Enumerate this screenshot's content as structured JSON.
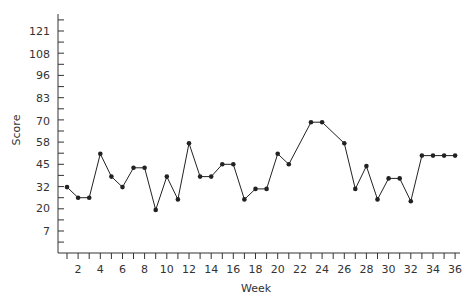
{
  "chart_data": {
    "type": "line",
    "title": "",
    "xlabel": "Week",
    "ylabel": "Score",
    "x_tick_labels": [
      2,
      4,
      6,
      8,
      10,
      12,
      14,
      16,
      18,
      20,
      22,
      24,
      26,
      28,
      30,
      32,
      34,
      36
    ],
    "y_tick_labels": [
      7,
      20,
      32,
      45,
      58,
      70,
      83,
      96,
      108,
      121
    ],
    "xlim": [
      0,
      36
    ],
    "ylim": [
      0,
      133
    ],
    "grid": false,
    "legend": null,
    "series": [
      {
        "name": "Score",
        "color": "#222222",
        "marker": "circle",
        "points": [
          {
            "x": 1,
            "y": 32
          },
          {
            "x": 2,
            "y": 26
          },
          {
            "x": 3,
            "y": 26
          },
          {
            "x": 4,
            "y": 51
          },
          {
            "x": 5,
            "y": 38
          },
          {
            "x": 6,
            "y": 32
          },
          {
            "x": 7,
            "y": 43
          },
          {
            "x": 8,
            "y": 43
          },
          {
            "x": 9,
            "y": 19
          },
          {
            "x": 10,
            "y": 38
          },
          {
            "x": 11,
            "y": 25
          },
          {
            "x": 12,
            "y": 57
          },
          {
            "x": 13,
            "y": 38
          },
          {
            "x": 14,
            "y": 38
          },
          {
            "x": 15,
            "y": 45
          },
          {
            "x": 16,
            "y": 45
          },
          {
            "x": 17,
            "y": 25
          },
          {
            "x": 18,
            "y": 31
          },
          {
            "x": 19,
            "y": 31
          },
          {
            "x": 20,
            "y": 51
          },
          {
            "x": 21,
            "y": 45
          },
          {
            "x": 23,
            "y": 69
          },
          {
            "x": 24,
            "y": 69
          },
          {
            "x": 26,
            "y": 57
          },
          {
            "x": 27,
            "y": 31
          },
          {
            "x": 28,
            "y": 44
          },
          {
            "x": 29,
            "y": 25
          },
          {
            "x": 30,
            "y": 37
          },
          {
            "x": 31,
            "y": 37
          },
          {
            "x": 32,
            "y": 24
          },
          {
            "x": 33,
            "y": 50
          },
          {
            "x": 34,
            "y": 50
          },
          {
            "x": 35,
            "y": 50
          },
          {
            "x": 36,
            "y": 50
          }
        ]
      }
    ]
  }
}
